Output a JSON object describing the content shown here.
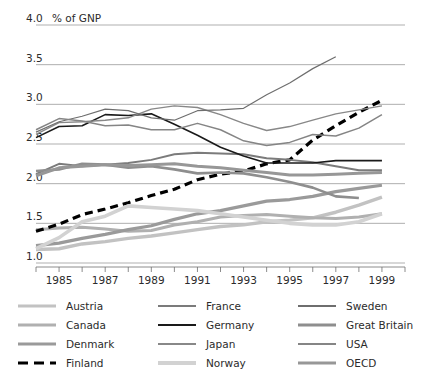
{
  "chart_data": {
    "type": "line",
    "title": "",
    "subtitle": "",
    "xlabel": "",
    "ylabel": "",
    "unit_label": "% of GNP",
    "xlim": [
      1984,
      2000
    ],
    "ylim": [
      1.0,
      4.0
    ],
    "yticks": [
      1.0,
      1.5,
      2.0,
      2.5,
      3.0,
      3.5,
      4.0
    ],
    "ytick_labels": [
      "1.0",
      "1.5",
      "2.0",
      "2.5",
      "3.0",
      "3.5",
      "4.0"
    ],
    "xticks": [
      1984,
      1985,
      1986,
      1987,
      1988,
      1989,
      1990,
      1991,
      1992,
      1993,
      1994,
      1995,
      1996,
      1997,
      1998,
      1999,
      2000
    ],
    "xtick_labels": [
      "1985",
      "1987",
      "1989",
      "1991",
      "1993",
      "1995",
      "1997",
      "1999"
    ],
    "xtick_label_years": [
      1985,
      1987,
      1989,
      1991,
      1993,
      1995,
      1997,
      1999
    ],
    "grid": true,
    "legend_position": "bottom",
    "legend_columns": 3,
    "series": [
      {
        "name": "Austria",
        "color": "#c2c2c2",
        "width": 3.4,
        "dash": "none",
        "x": [
          1984,
          1985,
          1986,
          1987,
          1988,
          1989,
          1990,
          1991,
          1992,
          1993,
          1994,
          1995,
          1996,
          1997,
          1998,
          1999
        ],
        "values": [
          1.17,
          1.18,
          1.24,
          1.27,
          1.31,
          1.34,
          1.38,
          1.42,
          1.46,
          1.48,
          1.52,
          1.54,
          1.57,
          1.64,
          1.73,
          1.83
        ]
      },
      {
        "name": "Canada",
        "color": "#b0b0b0",
        "width": 3.0,
        "dash": "none",
        "x": [
          1984,
          1985,
          1986,
          1987,
          1988,
          1989,
          1990,
          1991,
          1992,
          1993,
          1994,
          1995,
          1996,
          1997,
          1998,
          1999
        ],
        "values": [
          1.42,
          1.44,
          1.45,
          1.43,
          1.4,
          1.41,
          1.48,
          1.52,
          1.58,
          1.6,
          1.61,
          1.59,
          1.57,
          1.56,
          1.58,
          1.62
        ]
      },
      {
        "name": "Denmark",
        "color": "#9a9a9a",
        "width": 3.2,
        "dash": "none",
        "x": [
          1984,
          1985,
          1986,
          1987,
          1988,
          1989,
          1990,
          1991,
          1992,
          1993,
          1994,
          1995,
          1996,
          1997,
          1998,
          1999
        ],
        "values": [
          1.22,
          1.25,
          1.31,
          1.36,
          1.42,
          1.47,
          1.55,
          1.62,
          1.66,
          1.72,
          1.78,
          1.8,
          1.84,
          1.9,
          1.94,
          1.98
        ]
      },
      {
        "name": "Finland",
        "color": "#000000",
        "width": 3.2,
        "dash": "8,5",
        "x": [
          1984,
          1985,
          1986,
          1987,
          1988,
          1989,
          1990,
          1991,
          1992,
          1993,
          1994,
          1995,
          1996,
          1997,
          1998,
          1999
        ],
        "values": [
          1.4,
          1.49,
          1.61,
          1.68,
          1.76,
          1.85,
          1.93,
          2.05,
          2.12,
          2.16,
          2.25,
          2.3,
          2.55,
          2.73,
          2.9,
          3.05
        ]
      },
      {
        "name": "France",
        "color": "#7b7b7b",
        "width": 2.0,
        "dash": "none",
        "x": [
          1984,
          1985,
          1986,
          1987,
          1988,
          1989,
          1990,
          1991,
          1992,
          1993,
          1994,
          1995,
          1996,
          1997,
          1998,
          1999
        ],
        "values": [
          2.12,
          2.25,
          2.22,
          2.24,
          2.26,
          2.3,
          2.37,
          2.39,
          2.38,
          2.37,
          2.32,
          2.3,
          2.27,
          2.22,
          2.17,
          2.17
        ]
      },
      {
        "name": "Germany",
        "color": "#1a1a1a",
        "width": 1.6,
        "dash": "none",
        "x": [
          1984,
          1985,
          1986,
          1987,
          1988,
          1989,
          1990,
          1991,
          1992,
          1993,
          1994,
          1995,
          1996,
          1997,
          1998,
          1999
        ],
        "values": [
          2.58,
          2.72,
          2.73,
          2.87,
          2.86,
          2.88,
          2.75,
          2.61,
          2.46,
          2.35,
          2.26,
          2.26,
          2.26,
          2.29,
          2.29,
          2.29
        ]
      },
      {
        "name": "Japan",
        "color": "#888888",
        "width": 1.4,
        "dash": "none",
        "x": [
          1984,
          1985,
          1986,
          1987,
          1988,
          1989,
          1990,
          1991,
          1992,
          1993,
          1994,
          1995,
          1996,
          1997,
          1998,
          1999
        ],
        "values": [
          2.62,
          2.77,
          2.78,
          2.8,
          2.83,
          2.94,
          2.98,
          2.96,
          2.87,
          2.76,
          2.67,
          2.72,
          2.8,
          2.88,
          2.93,
          2.98
        ]
      },
      {
        "name": "Norway",
        "color": "#d2d2d2",
        "width": 3.6,
        "dash": "none",
        "x": [
          1984,
          1985,
          1986,
          1987,
          1988,
          1989,
          1990,
          1991,
          1992,
          1993,
          1994,
          1995,
          1996,
          1997,
          1998,
          1999
        ],
        "values": [
          1.18,
          1.32,
          1.52,
          1.59,
          1.72,
          1.7,
          1.68,
          1.66,
          1.62,
          1.58,
          1.54,
          1.5,
          1.48,
          1.48,
          1.52,
          1.62
        ]
      },
      {
        "name": "Sweden",
        "color": "#6e6e6e",
        "width": 1.2,
        "dash": "none",
        "x": [
          1984,
          1985,
          1986,
          1987,
          1988,
          1989,
          1990,
          1991,
          1992,
          1993,
          1994,
          1995,
          1996,
          1997
        ],
        "values": [
          2.65,
          2.78,
          2.85,
          2.94,
          2.92,
          2.83,
          2.8,
          2.92,
          2.93,
          2.95,
          3.12,
          3.27,
          3.45,
          3.6
        ]
      },
      {
        "name": "Great Britain",
        "color": "#8e8e8e",
        "width": 2.6,
        "dash": "none",
        "x": [
          1984,
          1985,
          1986,
          1987,
          1988,
          1989,
          1990,
          1991,
          1992,
          1993,
          1994,
          1995,
          1996,
          1997,
          1998
        ],
        "values": [
          2.16,
          2.18,
          2.25,
          2.24,
          2.2,
          2.22,
          2.18,
          2.13,
          2.14,
          2.13,
          2.08,
          2.02,
          1.95,
          1.84,
          1.82
        ]
      },
      {
        "name": "USA",
        "color": "#858585",
        "width": 1.5,
        "dash": "none",
        "x": [
          1984,
          1985,
          1986,
          1987,
          1988,
          1989,
          1990,
          1991,
          1992,
          1993,
          1994,
          1995,
          1996,
          1997,
          1998,
          1999
        ],
        "values": [
          2.68,
          2.82,
          2.79,
          2.73,
          2.74,
          2.68,
          2.68,
          2.76,
          2.68,
          2.54,
          2.48,
          2.52,
          2.62,
          2.6,
          2.7,
          2.87
        ]
      },
      {
        "name": "OECD",
        "color": "#979797",
        "width": 3.0,
        "dash": "none",
        "x": [
          1984,
          1985,
          1986,
          1987,
          1988,
          1989,
          1990,
          1991,
          1992,
          1993,
          1994,
          1995,
          1996,
          1997,
          1998,
          1999
        ],
        "values": [
          2.1,
          2.2,
          2.22,
          2.24,
          2.23,
          2.24,
          2.25,
          2.22,
          2.2,
          2.17,
          2.14,
          2.11,
          2.11,
          2.12,
          2.13,
          2.14
        ]
      }
    ]
  },
  "legend": {
    "columns": [
      {
        "items": [
          {
            "label": "Austria",
            "series": "Austria"
          },
          {
            "label": "Canada",
            "series": "Canada"
          },
          {
            "label": "Denmark",
            "series": "Denmark"
          },
          {
            "label": "Finland",
            "series": "Finland"
          }
        ]
      },
      {
        "items": [
          {
            "label": "France",
            "series": "France"
          },
          {
            "label": "Germany",
            "series": "Germany"
          },
          {
            "label": "Japan",
            "series": "Japan"
          },
          {
            "label": "Norway",
            "series": "Norway"
          }
        ]
      },
      {
        "items": [
          {
            "label": "Sweden",
            "series": "Sweden"
          },
          {
            "label": "Great Britain",
            "series": "Great Britain"
          },
          {
            "label": "USA",
            "series": "USA"
          },
          {
            "label": "OECD",
            "series": "OECD"
          }
        ]
      }
    ]
  }
}
